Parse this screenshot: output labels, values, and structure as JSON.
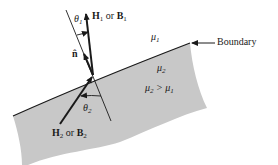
{
  "diagram": {
    "type": "boundary-condition-magnetic-field",
    "colors": {
      "region2_fill": "#c8c8c8",
      "line": "#1a1a1a",
      "background": "#ffffff"
    },
    "labels": {
      "theta1": "θ",
      "theta1_sub": "1",
      "h1_main": "H",
      "h1_sub": "1",
      "h1_or": " or ",
      "b1_main": "B",
      "b1_sub": "1",
      "normal": "n̂",
      "mu1": "μ",
      "mu1_sub": "1",
      "boundary": "Boundary",
      "mu2": "μ",
      "mu2_sub": "2",
      "mu_rel_a": "μ",
      "mu_rel_a_sub": "2",
      "mu_rel_op": " > ",
      "mu_rel_b": "μ",
      "mu_rel_b_sub": "1",
      "theta2": "θ",
      "theta2_sub": "2",
      "h2_main": "H",
      "h2_sub": "2",
      "h2_or": " or ",
      "b2_main": "B",
      "b2_sub": "2"
    }
  }
}
